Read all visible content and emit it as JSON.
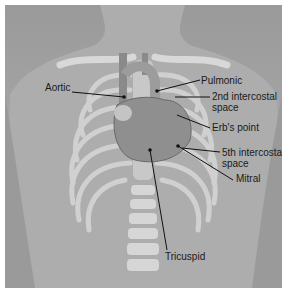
{
  "figure": {
    "labels": {
      "aortic": "Aortic",
      "pulmonic": "Pulmonic",
      "second_intercostal_line1": "2nd intercostal",
      "second_intercostal_line2": "space",
      "erbs_point": "Erb's point",
      "fifth_intercostal_line1": "5th intercostal",
      "fifth_intercostal_line2": "space",
      "mitral": "Mitral",
      "tricuspid": "Tricuspid"
    },
    "colors": {
      "background": "#a4a4a4",
      "bone": "#d6d6d6",
      "heart": "#8f8f8f",
      "leader_line": "#111111",
      "text": "#1a1a1a"
    }
  }
}
